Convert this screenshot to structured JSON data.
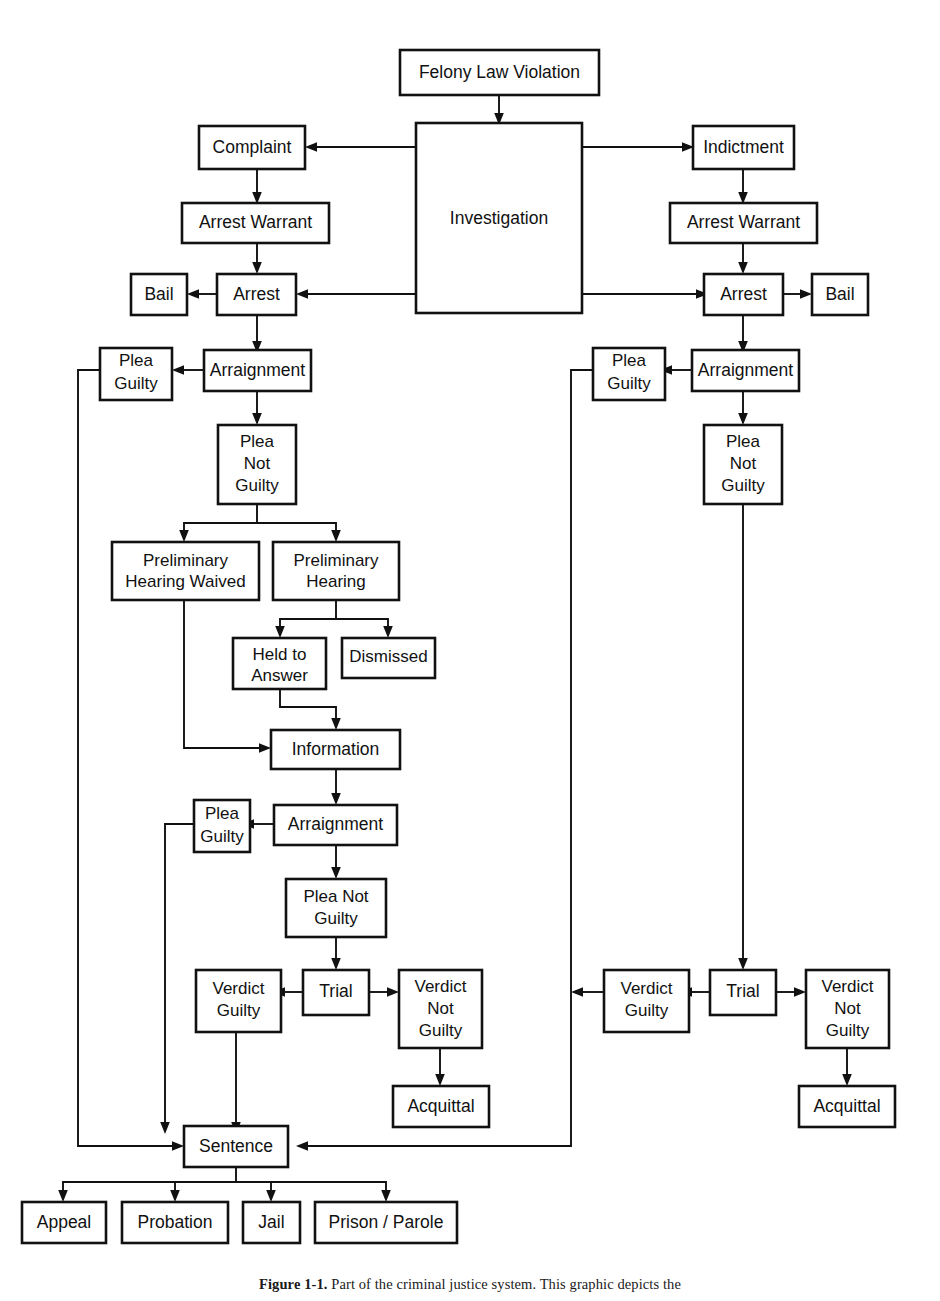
{
  "figure": {
    "caption_label": "Figure 1-1.",
    "caption_text": "Part of the criminal justice system. This graphic depicts the",
    "title": "Part of the criminal justice system"
  },
  "nodes": {
    "felony_law_violation": {
      "label": "Felony Law Violation"
    },
    "investigation": {
      "label": "Investigation"
    },
    "complaint": {
      "label": "Complaint"
    },
    "indictment": {
      "label": "Indictment"
    },
    "arrest_warrant_left": {
      "label": "Arrest Warrant"
    },
    "arrest_warrant_right": {
      "label": "Arrest Warrant"
    },
    "arrest_left": {
      "label": "Arrest"
    },
    "arrest_right": {
      "label": "Arrest"
    },
    "bail_left": {
      "label": "Bail"
    },
    "bail_right": {
      "label": "Bail"
    },
    "arraignment_left": {
      "label": "Arraignment"
    },
    "arraignment_right": {
      "label": "Arraignment"
    },
    "plea_guilty_left": {
      "line1": "Plea",
      "line2": "Guilty"
    },
    "plea_guilty_right": {
      "line1": "Plea",
      "line2": "Guilty"
    },
    "plea_not_guilty_left": {
      "line1": "Plea",
      "line2": "Not",
      "line3": "Guilty"
    },
    "plea_not_guilty_right": {
      "line1": "Plea",
      "line2": "Not",
      "line3": "Guilty"
    },
    "preliminary_hearing_waived": {
      "line1": "Preliminary",
      "line2": "Hearing Waived"
    },
    "preliminary_hearing": {
      "line1": "Preliminary",
      "line2": "Hearing"
    },
    "held_to_answer": {
      "line1": "Held to",
      "line2": "Answer"
    },
    "dismissed": {
      "label": "Dismissed"
    },
    "information": {
      "label": "Information"
    },
    "arraignment_information": {
      "label": "Arraignment"
    },
    "plea_guilty_information": {
      "line1": "Plea",
      "line2": "Guilty"
    },
    "plea_not_guilty_information": {
      "line1": "Plea Not",
      "line2": "Guilty"
    },
    "trial_left": {
      "label": "Trial"
    },
    "trial_right": {
      "label": "Trial"
    },
    "verdict_guilty_left": {
      "line1": "Verdict",
      "line2": "Guilty"
    },
    "verdict_guilty_right": {
      "line1": "Verdict",
      "line2": "Guilty"
    },
    "verdict_not_guilty_left": {
      "line1": "Verdict",
      "line2": "Not",
      "line3": "Guilty"
    },
    "verdict_not_guilty_right": {
      "line1": "Verdict",
      "line2": "Not",
      "line3": "Guilty"
    },
    "acquittal_left": {
      "label": "Acquittal"
    },
    "acquittal_right": {
      "label": "Acquittal"
    },
    "sentence": {
      "label": "Sentence"
    },
    "appeal": {
      "label": "Appeal"
    },
    "probation": {
      "label": "Probation"
    },
    "jail": {
      "label": "Jail"
    },
    "prison_parole": {
      "label": "Prison / Parole"
    }
  },
  "style": {
    "stroke_color": "#111111",
    "fill_color": "#ffffff",
    "background": "#ffffff"
  }
}
